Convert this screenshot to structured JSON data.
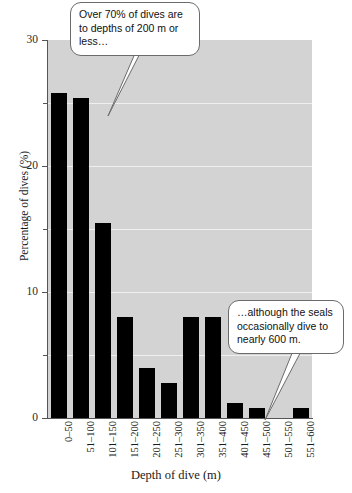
{
  "chart_data": {
    "type": "bar",
    "title": "",
    "subtitle": "",
    "xlabel": "Depth of dive (m)",
    "ylabel": "Percentage of dives (%)",
    "categories": [
      "0–50",
      "51–100",
      "101–150",
      "151–200",
      "201–250",
      "251–300",
      "301–350",
      "351–400",
      "401–450",
      "451–500",
      "501–550",
      "551–600"
    ],
    "values": [
      25.8,
      25.4,
      15.5,
      8.0,
      4.0,
      2.8,
      8.0,
      8.0,
      1.2,
      0.8,
      0.0,
      0.8
    ],
    "ylim": [
      0,
      30
    ],
    "xlim_note": "categorical",
    "y_major_ticks": [
      0,
      10,
      20,
      30
    ],
    "y_minor_ticks": [
      5,
      15,
      25
    ],
    "y_tick_labels": [
      "0",
      "10",
      "20",
      "30"
    ],
    "gridlines": [
      5,
      10,
      15,
      20,
      25
    ],
    "grid": true,
    "legend": "none",
    "bar_color": "#000000",
    "plot_background": "#d3d3d3",
    "gridline_color": "#efefef",
    "annotations": [
      {
        "id": "callout-1",
        "text": "Over 70% of dives are to depths of 200 m or less…",
        "points_to_category": "151–200"
      },
      {
        "id": "callout-2",
        "text": "…although the seals occasionally dive to nearly 600 m.",
        "points_to_category": "551–600"
      }
    ]
  },
  "axes": {
    "y_title": "Percentage of dives (%)",
    "x_title": "Depth of dive (m)"
  },
  "bottom_caption": ""
}
